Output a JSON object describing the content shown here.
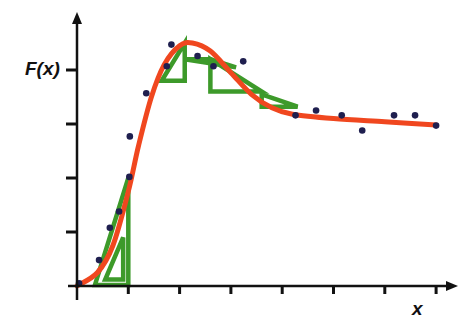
{
  "chart_data": {
    "type": "line",
    "title": "",
    "xlabel": "x",
    "ylabel": "F(x)",
    "x_ticks": 7,
    "y_ticks": 4,
    "tick_labels_shown": false,
    "grid": false,
    "legend": null,
    "xlim": [
      0,
      7.2
    ],
    "ylim": [
      0,
      4.4
    ],
    "series": [
      {
        "name": "data points",
        "kind": "scatter",
        "color": "#1f1f4f",
        "points": [
          [
            0.04,
            0.05
          ],
          [
            0.43,
            0.48
          ],
          [
            0.64,
            1.08
          ],
          [
            0.82,
            1.38
          ],
          [
            1.02,
            2.02
          ],
          [
            1.03,
            2.77
          ],
          [
            1.35,
            3.57
          ],
          [
            1.75,
            4.07
          ],
          [
            1.84,
            4.47
          ],
          [
            2.35,
            4.26
          ],
          [
            2.66,
            4.07
          ],
          [
            3.24,
            4.16
          ],
          [
            4.26,
            3.16
          ],
          [
            4.66,
            3.25
          ],
          [
            5.16,
            3.16
          ],
          [
            5.56,
            2.88
          ],
          [
            6.18,
            3.16
          ],
          [
            6.59,
            3.16
          ],
          [
            7.0,
            2.97
          ]
        ]
      },
      {
        "name": "fitted curve",
        "kind": "line",
        "color": "#f0471f",
        "points": [
          [
            0.0,
            0.0
          ],
          [
            0.4,
            0.25
          ],
          [
            0.7,
            0.75
          ],
          [
            1.0,
            1.75
          ],
          [
            1.2,
            2.6
          ],
          [
            1.45,
            3.5
          ],
          [
            1.7,
            4.1
          ],
          [
            2.0,
            4.45
          ],
          [
            2.25,
            4.5
          ],
          [
            2.6,
            4.35
          ],
          [
            3.0,
            3.95
          ],
          [
            3.4,
            3.55
          ],
          [
            3.8,
            3.3
          ],
          [
            4.2,
            3.18
          ],
          [
            5.0,
            3.1
          ],
          [
            6.0,
            3.04
          ],
          [
            7.0,
            2.98
          ]
        ]
      },
      {
        "name": "slope triangles",
        "kind": "triangles",
        "color": "#3d9a2a",
        "triangles": [
          [
            [
              0.35,
              0.02
            ],
            [
              1.0,
              0.02
            ],
            [
              1.0,
              2.0
            ]
          ],
          [
            [
              0.55,
              0.12
            ],
            [
              0.9,
              0.12
            ],
            [
              0.9,
              0.9
            ]
          ],
          [
            [
              1.65,
              3.8
            ],
            [
              2.1,
              3.8
            ],
            [
              2.1,
              4.5
            ]
          ],
          [
            [
              2.1,
              4.2
            ],
            [
              3.1,
              4.05
            ],
            [
              2.6,
              4.2
            ]
          ],
          [
            [
              2.6,
              3.6
            ],
            [
              3.6,
              3.6
            ],
            [
              2.6,
              4.2
            ]
          ],
          [
            [
              3.6,
              3.32
            ],
            [
              4.3,
              3.32
            ],
            [
              3.6,
              3.55
            ]
          ]
        ]
      }
    ]
  },
  "axes": {
    "y_label": "F(x)",
    "x_label": "x"
  }
}
